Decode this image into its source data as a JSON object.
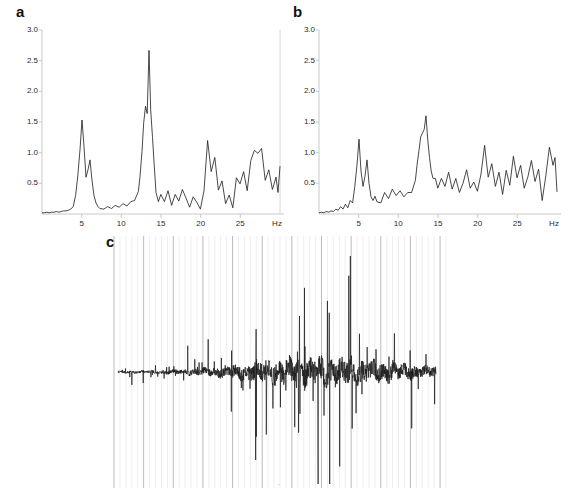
{
  "figure": {
    "background": "#ffffff",
    "trace_color": "#1a1a1a",
    "axis_color": "#c9c9c9",
    "gridline_minor_color": "#e2e2e2",
    "gridline_major_color": "#a8a8a8",
    "label_color": "#2b2b2b"
  },
  "panels": {
    "a": {
      "letter": "a"
    },
    "b": {
      "letter": "b"
    },
    "c": {
      "letter": "c"
    }
  },
  "axes": {
    "y_ticks": [
      "3.0",
      "2.5",
      "2.0",
      "1.5",
      "1.0",
      "0.5"
    ],
    "y_values": [
      3.0,
      2.5,
      2.0,
      1.5,
      1.0,
      0.5
    ],
    "x_ticks": [
      "5",
      "10",
      "15",
      "20",
      "25"
    ],
    "x_values": [
      5,
      10,
      15,
      20,
      25
    ],
    "x_unit": "Hz"
  },
  "chart_data": [
    {
      "type": "line",
      "panel": "a",
      "title": "",
      "xlabel": "Hz",
      "ylabel": "",
      "xlim": [
        0,
        30
      ],
      "ylim": [
        0,
        3.0
      ],
      "grid": false,
      "legend": "none",
      "x_tick_labels": [
        "5",
        "10",
        "15",
        "20",
        "25",
        "Hz"
      ],
      "y_tick_labels": [
        "0.5",
        "1.0",
        "1.5",
        "2.0",
        "2.5",
        "3.0"
      ],
      "annotations": [
        {
          "label": "theta/low-alpha peak",
          "x": 5.0,
          "y": 1.53
        },
        {
          "label": "alpha peak",
          "x": 10.0,
          "y": 2.65
        }
      ],
      "x": [
        0.0,
        0.3,
        0.6,
        0.9,
        1.2,
        1.5,
        1.8,
        2.1,
        2.4,
        2.7,
        3.0,
        3.3,
        3.6,
        3.9,
        4.2,
        4.35,
        4.5,
        4.65,
        4.8,
        4.95,
        5.1,
        5.25,
        5.4,
        5.55,
        5.7,
        5.85,
        6.0,
        6.3,
        6.6,
        6.9,
        7.2,
        7.5,
        7.8,
        8.1,
        8.4,
        8.7,
        9.0,
        9.2,
        9.4,
        9.55,
        9.7,
        9.85,
        10.0,
        10.15,
        10.3,
        10.45,
        10.6,
        10.8,
        11.0,
        11.3,
        11.6,
        11.9,
        12.2,
        12.5,
        12.8,
        13.1,
        13.4,
        13.7,
        14.0,
        14.3,
        14.6,
        14.9,
        15.2,
        15.5,
        15.8,
        16.1,
        16.4,
        16.7,
        17.0,
        17.3,
        17.6,
        17.9,
        18.2,
        18.5,
        18.8,
        19.1,
        19.4,
        19.7,
        20.0,
        20.3,
        20.6,
        20.9,
        21.2,
        21.5,
        21.8,
        22.1,
        22.4,
        22.7,
        23.0,
        23.3,
        23.6,
        23.9,
        24.2,
        24.5,
        24.8,
        25.1,
        25.4,
        25.7,
        26.0,
        26.3,
        26.6,
        26.9,
        27.2,
        27.5,
        27.8,
        28.1,
        28.4,
        28.7,
        29.0,
        29.3,
        29.6,
        30.0
      ],
      "values": [
        0.02,
        0.02,
        0.03,
        0.02,
        0.03,
        0.03,
        0.04,
        0.03,
        0.04,
        0.05,
        0.05,
        0.06,
        0.08,
        0.12,
        0.3,
        0.62,
        1.05,
        1.53,
        1.1,
        0.6,
        0.72,
        0.88,
        0.55,
        0.3,
        0.18,
        0.12,
        0.1,
        0.09,
        0.12,
        0.1,
        0.14,
        0.11,
        0.16,
        0.13,
        0.2,
        0.22,
        0.38,
        0.6,
        0.95,
        1.45,
        1.72,
        1.62,
        2.65,
        1.7,
        1.25,
        0.8,
        0.45,
        0.3,
        0.42,
        0.3,
        0.48,
        0.25,
        0.32,
        0.2,
        0.38,
        0.26,
        0.18,
        0.3,
        0.24,
        0.5,
        0.22,
        0.3,
        0.18,
        0.45,
        1.22,
        0.72,
        0.95,
        0.4,
        0.55,
        0.28,
        0.42,
        0.2,
        0.62,
        0.34,
        1.12,
        0.5,
        0.7,
        0.38,
        0.88,
        1.05,
        1.0,
        1.08,
        0.55,
        0.72,
        0.4,
        0.6,
        0.35,
        0.78,
        1.2,
        0.62,
        0.85,
        0.45,
        0.3,
        0.55,
        0.68,
        0.88,
        0.42,
        0.6,
        0.35,
        0.52,
        0.7,
        0.3,
        0.48,
        0.82,
        0.55,
        0.38,
        0.6,
        0.45,
        0.75,
        0.4,
        0.62,
        0.3
      ]
    },
    {
      "type": "line",
      "panel": "b",
      "title": "",
      "xlabel": "Hz",
      "ylabel": "",
      "xlim": [
        0,
        30
      ],
      "ylim": [
        0,
        3.0
      ],
      "grid": false,
      "legend": "none",
      "x_tick_labels": [
        "5",
        "10",
        "15",
        "20",
        "25",
        "Hz"
      ],
      "y_tick_labels": [
        "0.5",
        "1.0",
        "1.5",
        "2.0",
        "2.5",
        "3.0"
      ],
      "annotations": [
        {
          "label": "theta/low-alpha peak",
          "x": 5.0,
          "y": 1.22
        },
        {
          "label": "alpha peak",
          "x": 10.0,
          "y": 1.6
        }
      ],
      "x": [
        0.0,
        0.3,
        0.6,
        0.9,
        1.2,
        1.5,
        1.8,
        2.1,
        2.4,
        2.7,
        3.0,
        3.3,
        3.6,
        3.9,
        4.2,
        4.35,
        4.5,
        4.65,
        4.8,
        4.95,
        5.1,
        5.25,
        5.4,
        5.55,
        5.7,
        5.85,
        6.0,
        6.3,
        6.6,
        6.9,
        7.2,
        7.5,
        7.8,
        8.1,
        8.4,
        8.7,
        9.0,
        9.2,
        9.4,
        9.55,
        9.7,
        9.85,
        10.0,
        10.15,
        10.3,
        10.45,
        10.6,
        10.8,
        11.0,
        11.3,
        11.6,
        11.9,
        12.2,
        12.5,
        12.8,
        13.1,
        13.4,
        13.7,
        14.0,
        14.3,
        14.6,
        14.9,
        15.2,
        15.5,
        15.8,
        16.1,
        16.4,
        16.7,
        17.0,
        17.3,
        17.6,
        17.9,
        18.2,
        18.5,
        18.8,
        19.1,
        19.4,
        19.7,
        20.0,
        20.3,
        20.6,
        20.9,
        21.2,
        21.5,
        21.8,
        22.1,
        22.4,
        22.7,
        23.0,
        23.3,
        23.6,
        23.9,
        24.2,
        24.5,
        24.8,
        25.1,
        25.4,
        25.7,
        26.0,
        26.3,
        26.6,
        26.9,
        27.2,
        27.5,
        27.8,
        28.1,
        28.4,
        28.7,
        29.0,
        29.3,
        29.6,
        30.0
      ],
      "values": [
        0.02,
        0.03,
        0.02,
        0.04,
        0.03,
        0.05,
        0.04,
        0.08,
        0.06,
        0.12,
        0.08,
        0.16,
        0.1,
        0.22,
        0.18,
        0.45,
        0.8,
        1.22,
        0.7,
        0.45,
        0.62,
        0.88,
        0.5,
        0.28,
        0.22,
        0.3,
        0.2,
        0.32,
        0.18,
        0.35,
        0.25,
        0.4,
        0.3,
        0.38,
        0.28,
        0.42,
        0.35,
        0.55,
        0.78,
        1.1,
        1.32,
        1.18,
        1.6,
        1.22,
        0.95,
        0.7,
        0.52,
        0.58,
        0.42,
        0.62,
        0.38,
        0.55,
        0.45,
        0.68,
        0.4,
        0.58,
        0.35,
        0.62,
        0.48,
        0.72,
        0.42,
        0.55,
        0.38,
        0.65,
        1.12,
        0.6,
        0.82,
        0.45,
        0.68,
        0.4,
        0.58,
        0.35,
        0.72,
        0.48,
        0.95,
        0.55,
        0.78,
        0.42,
        0.62,
        0.88,
        0.5,
        1.02,
        0.58,
        0.75,
        0.4,
        0.55,
        0.32,
        0.68,
        1.1,
        0.72,
        0.85,
        0.48,
        0.62,
        0.55,
        0.8,
        0.92,
        0.5,
        0.68,
        0.42,
        0.58,
        0.75,
        0.45,
        0.62,
        0.88,
        0.52,
        0.7,
        0.4,
        0.62,
        0.85,
        0.48,
        0.72,
        0.35
      ]
    },
    {
      "type": "line",
      "panel": "c",
      "title": "",
      "xlabel": "",
      "ylabel": "",
      "grid": true,
      "grid_axis": "x",
      "gridline_count": 56,
      "gridline_major_every": 5,
      "legend": "none",
      "baseline": 0,
      "ylim": [
        -1,
        1
      ],
      "description": "bipolar time-domain trace with sharp bidirectional spikes, amplitude increasing toward the centre-right then tapering"
    }
  ]
}
